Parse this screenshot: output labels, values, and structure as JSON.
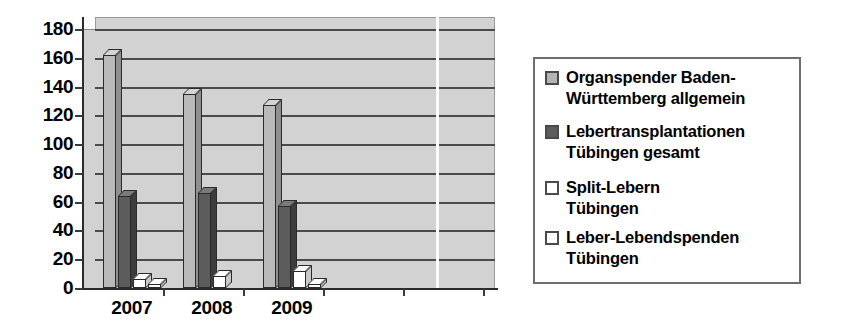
{
  "chart_data": {
    "type": "bar",
    "title": "",
    "subtitle": "",
    "xlabel": "",
    "ylabel": "",
    "categories": [
      "2007",
      "2008",
      "2009"
    ],
    "ylim": [
      0,
      180
    ],
    "yticks": [
      0,
      20,
      40,
      60,
      80,
      100,
      120,
      140,
      160,
      180
    ],
    "ytick_labels": [
      "0",
      "20",
      "40",
      "60",
      "80",
      "100",
      "120",
      "140",
      "160",
      "180"
    ],
    "grid": true,
    "legend_position": "right",
    "style": "3d-clustered-column",
    "series": [
      {
        "name": "Organspender Baden-Württemberg allgemein",
        "color": "#b9b9b9",
        "values": [
          162,
          135,
          127
        ]
      },
      {
        "name": "Lebertransplantationen Tübingen gesamt",
        "color": "#5c5c5c",
        "values": [
          64,
          66,
          57
        ]
      },
      {
        "name": "Split-Lebern Tübingen",
        "color": "#ffffff",
        "values": [
          6,
          8,
          12
        ]
      },
      {
        "name": "Leber-Lebendspenden Tübingen",
        "color": "#ffffff",
        "values": [
          3,
          0,
          3
        ]
      }
    ]
  },
  "legend": {
    "items": [
      {
        "label_line1": "Organspender Baden-",
        "label_line2": "Württemberg allgemein",
        "swatch": "light-gray"
      },
      {
        "label_line1": "Lebertransplantationen",
        "label_line2": "Tübingen gesamt",
        "swatch": "dark-gray"
      },
      {
        "label_line1": "Split-Lebern",
        "label_line2": "Tübingen",
        "swatch": "white"
      },
      {
        "label_line1": "Leber-Lebendspenden",
        "label_line2": "Tübingen",
        "swatch": "white"
      }
    ]
  },
  "colors": {
    "plot_background": "#d2d2d2",
    "gridline": "#4a4a4a",
    "axis": "#2b2b2b",
    "series1": "#b9b9b9",
    "series2": "#5c5c5c",
    "series3": "#ffffff",
    "series4": "#ffffff",
    "legend_border": "#6e6e6e",
    "page_background": "#ffffff"
  }
}
